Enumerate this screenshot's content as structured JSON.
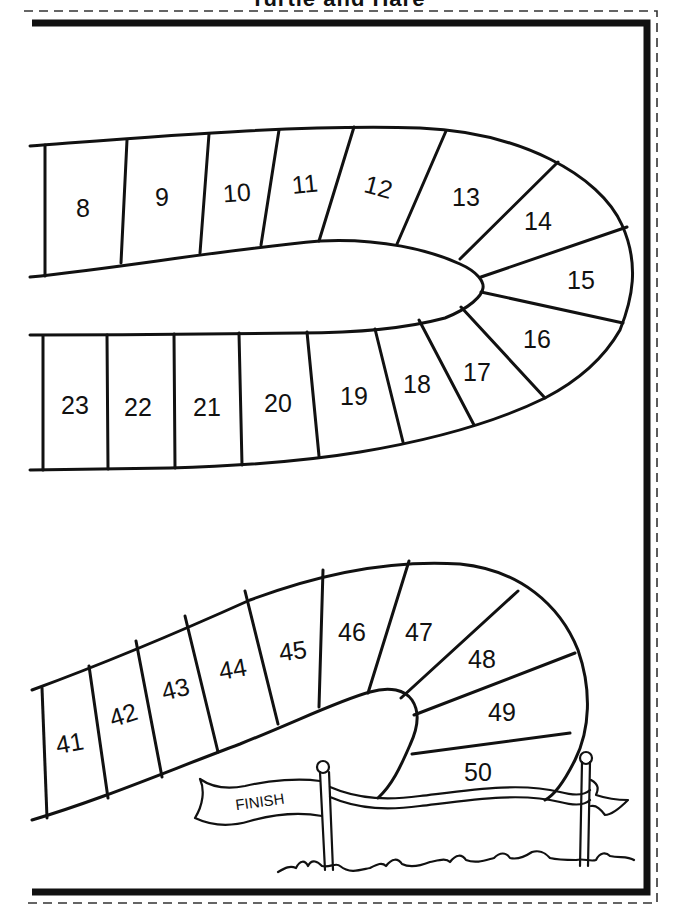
{
  "page": {
    "title": "Turtle and Hare"
  },
  "board": {
    "spaces": [
      {
        "n": "8"
      },
      {
        "n": "9"
      },
      {
        "n": "10"
      },
      {
        "n": "11"
      },
      {
        "n": "12"
      },
      {
        "n": "13"
      },
      {
        "n": "14"
      },
      {
        "n": "15"
      },
      {
        "n": "16"
      },
      {
        "n": "17"
      },
      {
        "n": "18"
      },
      {
        "n": "19"
      },
      {
        "n": "20"
      },
      {
        "n": "21"
      },
      {
        "n": "22"
      },
      {
        "n": "23"
      },
      {
        "n": "41"
      },
      {
        "n": "42"
      },
      {
        "n": "43"
      },
      {
        "n": "44"
      },
      {
        "n": "45"
      },
      {
        "n": "46"
      },
      {
        "n": "47"
      },
      {
        "n": "48"
      },
      {
        "n": "49"
      },
      {
        "n": "50"
      }
    ],
    "finish_label": "FINISH"
  },
  "colors": {
    "ink": "#111111",
    "paper": "#ffffff"
  }
}
